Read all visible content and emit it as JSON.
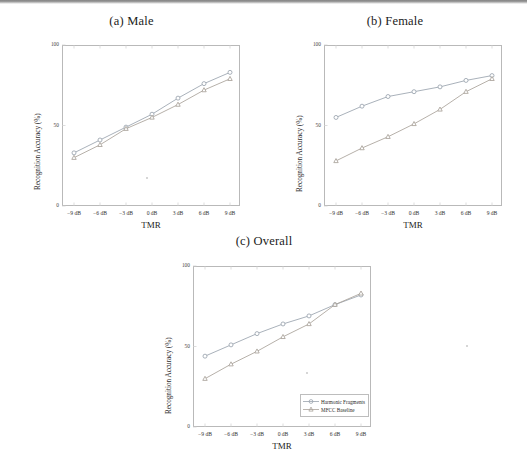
{
  "figure": {
    "shared": {
      "xlabel": "TMR",
      "ylabel": "Recognition Accuracy (%)",
      "xticks": [
        "−9 dB",
        "−6 dB",
        "−3 dB",
        "0 dB",
        "3 dB",
        "6 dB",
        "9 dB"
      ],
      "yticks": [
        "0",
        "50",
        "100"
      ],
      "series_names": [
        "Harmonic Fragments",
        "MFCC Baseline"
      ],
      "colors": {
        "harmonic": "#9aa3ad",
        "mfcc": "#a9a29a",
        "axis": "#b9b9b9",
        "text": "#1b1b1b"
      }
    },
    "legend": {
      "position": "bottom-right",
      "items": [
        {
          "label": "Harmonic Fragments",
          "marker": "circle"
        },
        {
          "label": "MFCC Baseline",
          "marker": "triangle"
        }
      ]
    },
    "panels": [
      {
        "id": "male",
        "title": "(a) Male"
      },
      {
        "id": "female",
        "title": "(b) Female"
      },
      {
        "id": "overall",
        "title": "(c) Overall"
      }
    ]
  },
  "chart_data": [
    {
      "type": "line",
      "title": "(a) Male",
      "xlabel": "TMR",
      "ylabel": "Recognition Accuracy (%)",
      "categories": [
        "−9 dB",
        "−6 dB",
        "−3 dB",
        "0 dB",
        "3 dB",
        "6 dB",
        "9 dB"
      ],
      "ylim": [
        0,
        100
      ],
      "yticks": [
        0,
        50,
        100
      ],
      "grid": false,
      "legend": "none",
      "series": [
        {
          "name": "Harmonic Fragments",
          "marker": "circle",
          "values": [
            33,
            41,
            49,
            57,
            67,
            76,
            83
          ]
        },
        {
          "name": "MFCC Baseline",
          "marker": "triangle",
          "values": [
            30,
            38,
            48,
            55,
            63,
            72,
            79
          ]
        }
      ]
    },
    {
      "type": "line",
      "title": "(b) Female",
      "xlabel": "TMR",
      "ylabel": "Recognition Accuracy (%)",
      "categories": [
        "−9 dB",
        "−6 dB",
        "−3 dB",
        "0 dB",
        "3 dB",
        "6 dB",
        "9 dB"
      ],
      "ylim": [
        0,
        100
      ],
      "yticks": [
        0,
        50,
        100
      ],
      "grid": false,
      "legend": "none",
      "series": [
        {
          "name": "Harmonic Fragments",
          "marker": "circle",
          "values": [
            55,
            62,
            68,
            71,
            74,
            78,
            81
          ]
        },
        {
          "name": "MFCC Baseline",
          "marker": "triangle",
          "values": [
            28,
            36,
            43,
            51,
            60,
            71,
            79
          ]
        }
      ]
    },
    {
      "type": "line",
      "title": "(c) Overall",
      "xlabel": "TMR",
      "ylabel": "Recognition Accuracy (%)",
      "categories": [
        "−9 dB",
        "−6 dB",
        "−3 dB",
        "0 dB",
        "3 dB",
        "6 dB",
        "9 dB"
      ],
      "ylim": [
        0,
        100
      ],
      "yticks": [
        0,
        50,
        100
      ],
      "grid": false,
      "legend": "bottom-right",
      "series": [
        {
          "name": "Harmonic Fragments",
          "marker": "circle",
          "values": [
            44,
            51,
            58,
            64,
            69,
            76,
            82
          ]
        },
        {
          "name": "MFCC Baseline",
          "marker": "triangle",
          "values": [
            30,
            39,
            47,
            56,
            64,
            76,
            83
          ]
        }
      ]
    }
  ]
}
